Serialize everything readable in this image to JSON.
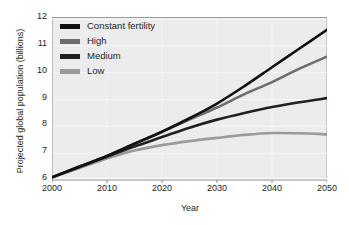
{
  "chart_data": {
    "type": "line",
    "title": "",
    "xlabel": "Year",
    "ylabel": "Projected global population (billions)",
    "xlim": [
      2000,
      2050
    ],
    "ylim": [
      6,
      12
    ],
    "xticks": [
      2000,
      2010,
      2020,
      2030,
      2040,
      2050
    ],
    "yticks": [
      6,
      7,
      8,
      9,
      10,
      11,
      12
    ],
    "grid": true,
    "legend_position": "top-left",
    "x": [
      2000,
      2005,
      2010,
      2015,
      2020,
      2025,
      2030,
      2035,
      2040,
      2045,
      2050
    ],
    "series": [
      {
        "name": "Constant fertility",
        "color": "#111111",
        "values": [
          6.1,
          6.5,
          6.9,
          7.35,
          7.8,
          8.3,
          8.85,
          9.5,
          10.2,
          10.9,
          11.6
        ]
      },
      {
        "name": "High",
        "color": "#6d6d6d",
        "values": [
          6.1,
          6.5,
          6.9,
          7.35,
          7.8,
          8.25,
          8.7,
          9.2,
          9.65,
          10.15,
          10.6
        ]
      },
      {
        "name": "Medium",
        "color": "#231f20",
        "values": [
          6.1,
          6.48,
          6.87,
          7.25,
          7.6,
          7.95,
          8.25,
          8.5,
          8.72,
          8.9,
          9.05
        ]
      },
      {
        "name": "Low",
        "color": "#9a9a9a",
        "values": [
          6.1,
          6.45,
          6.8,
          7.1,
          7.3,
          7.45,
          7.57,
          7.68,
          7.75,
          7.74,
          7.7
        ]
      }
    ]
  }
}
